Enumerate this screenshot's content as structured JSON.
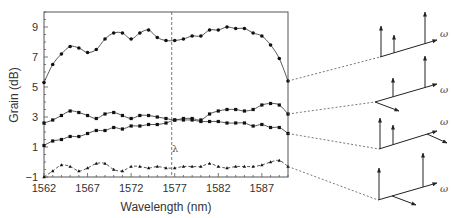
{
  "chart_data": {
    "type": "line",
    "title": "",
    "xlabel": "Wavelength (nm)",
    "ylabel": "Grain (dB)",
    "xlim": [
      1562,
      1590
    ],
    "ylim": [
      -1,
      10
    ],
    "xticks": [
      1562,
      1567,
      1572,
      1577,
      1582,
      1587
    ],
    "yticks": [
      -1,
      1,
      3,
      5,
      7,
      9
    ],
    "grid": false,
    "legend": null,
    "annotations": [
      {
        "text": "λ",
        "x": 1577,
        "note": "vertical dashed marker line at 1577 nm"
      }
    ],
    "x": [
      1562,
      1563,
      1564,
      1565,
      1566,
      1567,
      1568,
      1569,
      1570,
      1571,
      1572,
      1573,
      1574,
      1575,
      1576,
      1577,
      1578,
      1579,
      1580,
      1581,
      1582,
      1583,
      1584,
      1585,
      1586,
      1587,
      1588,
      1589,
      1590
    ],
    "series": [
      {
        "name": "curve-1",
        "style": "solid",
        "marker": "circle",
        "values": [
          5.3,
          6.5,
          7.2,
          7.7,
          7.6,
          7.3,
          7.5,
          8.2,
          8.6,
          8.6,
          8.2,
          8.6,
          8.8,
          8.3,
          8.1,
          8.1,
          8.2,
          8.4,
          8.4,
          8.8,
          8.8,
          9.0,
          8.9,
          8.9,
          8.6,
          8.4,
          7.8,
          6.9,
          5.4
        ]
      },
      {
        "name": "curve-2",
        "style": "solid",
        "marker": "square",
        "values": [
          2.6,
          2.8,
          3.1,
          3.4,
          3.3,
          3.1,
          2.9,
          3.2,
          3.3,
          3.1,
          2.9,
          3.1,
          3.1,
          3.0,
          2.9,
          2.8,
          2.9,
          2.9,
          2.8,
          3.2,
          3.4,
          3.5,
          3.5,
          3.4,
          3.5,
          3.8,
          3.9,
          3.8,
          3.2
        ]
      },
      {
        "name": "curve-3",
        "style": "solid",
        "marker": "square",
        "values": [
          1.1,
          1.4,
          1.5,
          1.7,
          1.7,
          1.9,
          2.1,
          2.1,
          2.3,
          2.2,
          2.4,
          2.4,
          2.5,
          2.5,
          2.6,
          2.8,
          2.8,
          2.8,
          2.7,
          2.7,
          2.7,
          2.6,
          2.6,
          2.6,
          2.4,
          2.5,
          2.3,
          2.3,
          1.9
        ]
      },
      {
        "name": "curve-4",
        "style": "dashed",
        "marker": "triangle",
        "values": [
          -1.0,
          -0.6,
          -0.2,
          -0.3,
          -0.6,
          -0.4,
          -0.1,
          -0.1,
          -0.5,
          -0.6,
          -0.3,
          -0.3,
          -0.4,
          -0.3,
          -0.4,
          -0.4,
          -0.3,
          -0.3,
          -0.3,
          -0.1,
          -0.3,
          -0.4,
          -0.3,
          -0.3,
          -0.3,
          -0.2,
          0.0,
          0.1,
          -0.3
        ]
      }
    ],
    "side_diagrams": [
      {
        "id": "spectrum-1",
        "axis_label": "ω",
        "arrows": [
          {
            "x": 381,
            "top": 26
          },
          {
            "x": 394,
            "top": 35
          },
          {
            "x": 425,
            "top": 12
          }
        ],
        "axis_from": [
          380,
          57
        ],
        "axis_to": [
          437,
          40
        ],
        "side_arrow": false,
        "connects_series": "curve-1"
      },
      {
        "id": "spectrum-2",
        "axis_label": "ω",
        "arrows": [
          {
            "x": 393,
            "top": 78
          },
          {
            "x": 425,
            "top": 56
          }
        ],
        "axis_from": [
          375,
          102
        ],
        "axis_to": [
          437,
          84
        ],
        "side_arrow": true,
        "connects_series": "curve-2"
      },
      {
        "id": "spectrum-3",
        "axis_label": "ω",
        "arrows": [
          {
            "x": 380,
            "top": 118
          },
          {
            "x": 393,
            "top": 125
          }
        ],
        "axis_from": [
          379,
          149
        ],
        "axis_to": [
          437,
          131
        ],
        "side_arrow": true,
        "connects_series": "curve-3"
      },
      {
        "id": "spectrum-4",
        "axis_label": "ω",
        "arrows": [
          {
            "x": 379,
            "top": 168
          },
          {
            "x": 423,
            "top": 153
          }
        ],
        "axis_from": [
          378,
          200
        ],
        "axis_to": [
          437,
          183
        ],
        "side_arrow": true,
        "connects_series": "curve-4"
      }
    ]
  }
}
